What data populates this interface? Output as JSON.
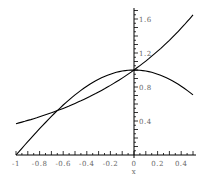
{
  "chart_data": {
    "type": "line",
    "title": "",
    "xlabel": "x",
    "ylabel": "",
    "xlim": [
      -1,
      0.5
    ],
    "ylim": [
      0,
      1.7
    ],
    "x_ticks": [
      "-1",
      "-0.8",
      "-0.6",
      "-0.4",
      "-0.2",
      "0",
      "0.2",
      "0.4"
    ],
    "y_ticks": [
      "0.4",
      "0.8",
      "1.2",
      "1.6"
    ],
    "grid": false,
    "legend": null,
    "series": [
      {
        "name": "exp(x)",
        "x": [
          -1,
          -0.75,
          -0.5,
          -0.25,
          0,
          0.25,
          0.5
        ],
        "values": [
          0.37,
          0.47,
          0.61,
          0.78,
          1.0,
          1.28,
          1.65
        ]
      },
      {
        "name": "cos(pi*x/2)",
        "x": [
          -1,
          -0.75,
          -0.5,
          -0.25,
          0,
          0.25,
          0.5
        ],
        "values": [
          0.0,
          0.38,
          0.71,
          0.92,
          1.0,
          0.92,
          0.71
        ]
      }
    ]
  }
}
